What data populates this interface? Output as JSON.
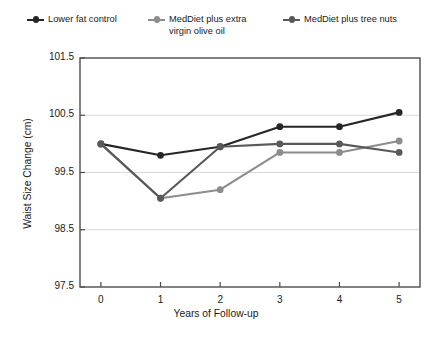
{
  "chart_data": {
    "type": "line",
    "title": "",
    "xlabel": "Years of Follow-up",
    "ylabel": "Waist Size  Change (cm)",
    "x": [
      0,
      1,
      2,
      3,
      4,
      5
    ],
    "xtick_labels": [
      "0",
      "1",
      "2",
      "3",
      "4",
      "5"
    ],
    "ytick_labels": [
      "97.5",
      "98.5",
      "99.5",
      "100.5",
      "101.5"
    ],
    "yticks": [
      97.5,
      98.5,
      99.5,
      100.5,
      101.5
    ],
    "xlim": [
      -0.35,
      5.35
    ],
    "ylim": [
      97.5,
      101.5
    ],
    "grid": "horizontal",
    "legend_position": "top",
    "series": [
      {
        "name": "Lower fat control",
        "color": "#262626",
        "values": [
          100.0,
          99.8,
          99.95,
          100.3,
          100.3,
          100.55
        ]
      },
      {
        "name": "MedDiet plus extra virgin olive oil",
        "name_line1": "MedDiet plus extra",
        "name_line2": "virgin olive oil",
        "color": "#8c8c8c",
        "values": [
          100.0,
          99.05,
          99.2,
          99.85,
          99.85,
          100.05
        ]
      },
      {
        "name": "MedDiet plus tree nuts",
        "color": "#595959",
        "values": [
          100.0,
          99.05,
          99.95,
          100.0,
          100.0,
          99.85
        ]
      }
    ]
  },
  "legend": {
    "items": [
      {
        "label": "Lower fat control"
      },
      {
        "label_line1": "MedDiet plus extra",
        "label_line2": "virgin olive oil"
      },
      {
        "label": "MedDiet plus tree nuts"
      }
    ]
  },
  "axes": {
    "x_title": "Years of Follow-up",
    "y_title": "Waist Size  Change (cm)",
    "y_ticks": [
      "101.5",
      "100.5",
      "99.5",
      "98.5",
      "97.5"
    ],
    "x_ticks": [
      "0",
      "1",
      "2",
      "3",
      "4",
      "5"
    ]
  },
  "colors": {
    "series_control": "#262626",
    "series_olive_oil": "#8c8c8c",
    "series_tree_nuts": "#595959",
    "grid": "#d9d9d9",
    "axis": "#4d4d4d",
    "background": "#ffffff"
  }
}
